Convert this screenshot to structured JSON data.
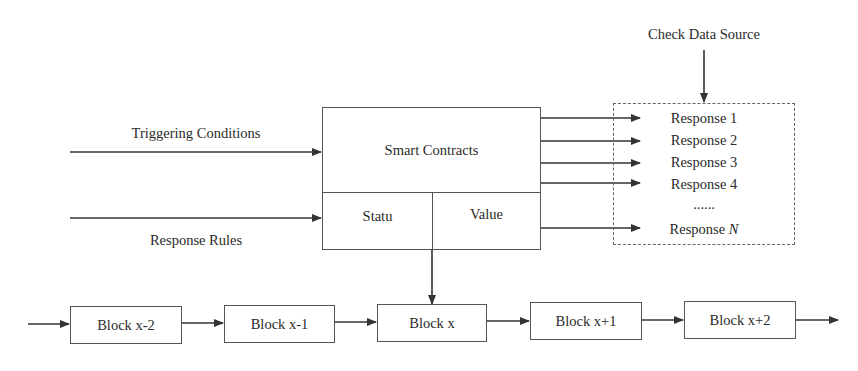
{
  "diagram": {
    "inputs": {
      "triggering_conditions": "Triggering Conditions",
      "response_rules": "Response Rules"
    },
    "smart_contract": {
      "title": "Smart Contracts",
      "status": "Statu",
      "value": "Value"
    },
    "check_data_source": "Check Data Source",
    "responses": {
      "items": [
        "Response 1",
        "Response 2",
        "Response 3",
        "Response 4"
      ],
      "ellipsis": "......",
      "last_prefix": "Response ",
      "last_var": "N"
    },
    "blocks": [
      "Block x-2",
      "Block x-1",
      "Block x",
      "Block x+1",
      "Block x+2"
    ],
    "colors": {
      "line": "#333333",
      "box_border": "#555555",
      "text": "#2a2a2a"
    }
  }
}
